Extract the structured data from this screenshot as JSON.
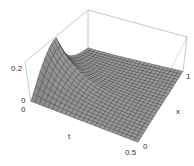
{
  "chart_data": {
    "type": "surface",
    "title": "",
    "xlabel": "t",
    "ylabel": "x",
    "zlabel": "",
    "x_axis": {
      "label": "t",
      "range": [
        0,
        0.5
      ],
      "ticks": [
        "0",
        "0.5"
      ]
    },
    "y_axis": {
      "label": "x",
      "range": [
        0,
        1
      ],
      "ticks": [
        "0",
        "1"
      ]
    },
    "z_axis": {
      "range": [
        0,
        0.25
      ],
      "ticks": [
        "0",
        "0.2"
      ]
    },
    "grid_resolution": [
      25,
      25
    ],
    "surface_color": "#9a9a9a",
    "mesh_color": "#2a2a2a",
    "box_color": "#b0b0b0"
  },
  "labels": {
    "z_top": "0.2",
    "z_bottom": "0",
    "t_start": "0",
    "t_end": "0.5",
    "t_name": "t",
    "x_start": "0",
    "x_end": "1",
    "x_name": "x"
  }
}
